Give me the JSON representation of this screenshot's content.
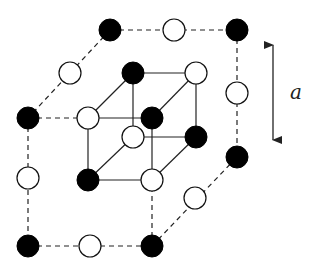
{
  "diagram": {
    "dimension_label": "a",
    "colors": {
      "atom_type_a": "#000000",
      "atom_type_b": "#ffffff",
      "lines": "#222222"
    },
    "atom_radius": 11,
    "outer_atoms": [
      {
        "id": "o1",
        "x": 110,
        "y": 30,
        "type": "black"
      },
      {
        "id": "o2",
        "x": 174,
        "y": 30,
        "type": "white"
      },
      {
        "id": "o3",
        "x": 237,
        "y": 30,
        "type": "black"
      },
      {
        "id": "o4",
        "x": 70,
        "y": 73,
        "type": "white"
      },
      {
        "id": "o5",
        "x": 28,
        "y": 118,
        "type": "black"
      },
      {
        "id": "o6",
        "x": 237,
        "y": 93,
        "type": "white"
      },
      {
        "id": "o7",
        "x": 237,
        "y": 157,
        "type": "black"
      },
      {
        "id": "o8",
        "x": 28,
        "y": 178,
        "type": "white"
      },
      {
        "id": "o9",
        "x": 195,
        "y": 198,
        "type": "white"
      },
      {
        "id": "o10",
        "x": 28,
        "y": 246,
        "type": "black"
      },
      {
        "id": "o11",
        "x": 90,
        "y": 246,
        "type": "white"
      },
      {
        "id": "o12",
        "x": 152,
        "y": 246,
        "type": "black"
      }
    ],
    "inner_atoms": [
      {
        "id": "i1",
        "x": 133,
        "y": 73,
        "type": "black"
      },
      {
        "id": "i2",
        "x": 196,
        "y": 73,
        "type": "white"
      },
      {
        "id": "i3",
        "x": 88,
        "y": 118,
        "type": "white"
      },
      {
        "id": "i4",
        "x": 152,
        "y": 118,
        "type": "black"
      },
      {
        "id": "i5",
        "x": 133,
        "y": 137,
        "type": "white"
      },
      {
        "id": "i6",
        "x": 196,
        "y": 137,
        "type": "black"
      },
      {
        "id": "i7",
        "x": 88,
        "y": 180,
        "type": "black"
      },
      {
        "id": "i8",
        "x": 152,
        "y": 180,
        "type": "white"
      }
    ],
    "dashed_bonds": [
      [
        "o1",
        "o3"
      ],
      [
        "o1",
        "o5"
      ],
      [
        "o3",
        "o7"
      ],
      [
        "o5",
        "o10"
      ],
      [
        "o10",
        "o12"
      ],
      [
        "o12",
        "o7"
      ],
      [
        "o5",
        "i3"
      ],
      [
        "o12",
        "i8"
      ]
    ],
    "solid_bonds": [
      [
        "i1",
        "i2"
      ],
      [
        "i3",
        "i4"
      ],
      [
        "i5",
        "i6"
      ],
      [
        "i7",
        "i8"
      ],
      [
        "i1",
        "i5"
      ],
      [
        "i2",
        "i6"
      ],
      [
        "i3",
        "i7"
      ],
      [
        "i4",
        "i8"
      ],
      [
        "i1",
        "i3"
      ],
      [
        "i2",
        "i4"
      ],
      [
        "i5",
        "i7"
      ],
      [
        "i6",
        "i8"
      ]
    ],
    "arrow": {
      "x": 273,
      "y1": 35,
      "y2": 150
    },
    "label_pos": {
      "x": 296,
      "y": 99
    }
  }
}
